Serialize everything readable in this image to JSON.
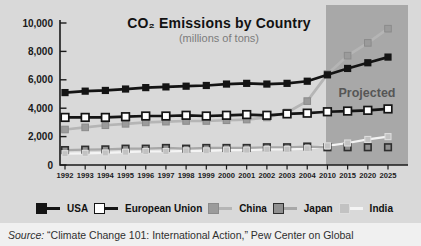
{
  "figure": {
    "projected_label": "Projected",
    "source_prefix": "Source:",
    "source_text": " “Climate Change 101: International Action,” Pew Center on Global"
  },
  "chart_data": {
    "type": "line",
    "title": "CO₂ Emissions by Country",
    "subtitle": "(millions of tons)",
    "categories": [
      "1992",
      "1993",
      "1994",
      "1995",
      "1996",
      "1997",
      "1998",
      "1999",
      "2000",
      "2001",
      "2002",
      "2003",
      "2004",
      "2010",
      "2015",
      "2020",
      "2025"
    ],
    "ylim": [
      0,
      10000
    ],
    "yticks": {
      "values": [
        0,
        2000,
        4000,
        6000,
        8000,
        10000
      ],
      "labels": [
        "0",
        "2,000",
        "4,000",
        "6,000",
        "8,000",
        "10,000"
      ]
    },
    "grid": false,
    "legend_position": "bottom",
    "projected_from_category": "2010",
    "projected_region_color": "#a8a8a8",
    "plot_bg_color": "#d9d9d9",
    "series": [
      {
        "name": "USA",
        "line_color": "#141414",
        "marker_color": "#141414",
        "marker_border": "#141414",
        "values": [
          5100,
          5200,
          5250,
          5350,
          5450,
          5500,
          5550,
          5600,
          5700,
          5750,
          5700,
          5750,
          5900,
          6350,
          6800,
          7200,
          7600
        ]
      },
      {
        "name": "European Union",
        "line_color": "#141414",
        "marker_color": "#ffffff",
        "marker_border": "#141414",
        "values": [
          3350,
          3350,
          3350,
          3400,
          3450,
          3450,
          3500,
          3450,
          3500,
          3550,
          3500,
          3600,
          3650,
          3750,
          3800,
          3850,
          3950
        ]
      },
      {
        "name": "China",
        "line_color": "#b5b5b5",
        "marker_color": "#9b9b9b",
        "marker_border": "#8b8b8b",
        "values": [
          2500,
          2650,
          2800,
          2900,
          3000,
          3050,
          3100,
          3100,
          3150,
          3200,
          3350,
          3700,
          4500,
          6400,
          7700,
          8600,
          9600
        ]
      },
      {
        "name": "Japan",
        "line_color": "#a8a8a8",
        "marker_color": "#909090",
        "marker_border": "#2e2e2e",
        "values": [
          1050,
          1080,
          1100,
          1150,
          1150,
          1200,
          1150,
          1200,
          1200,
          1200,
          1250,
          1250,
          1300,
          1250,
          1250,
          1250,
          1250
        ]
      },
      {
        "name": "India",
        "line_color": "#f4f4f4",
        "marker_color": "#c2c2c2",
        "marker_border": "#dddddd",
        "values": [
          800,
          820,
          850,
          900,
          950,
          950,
          1000,
          1000,
          1050,
          1050,
          1100,
          1100,
          1150,
          1350,
          1550,
          1800,
          2000
        ]
      }
    ]
  }
}
